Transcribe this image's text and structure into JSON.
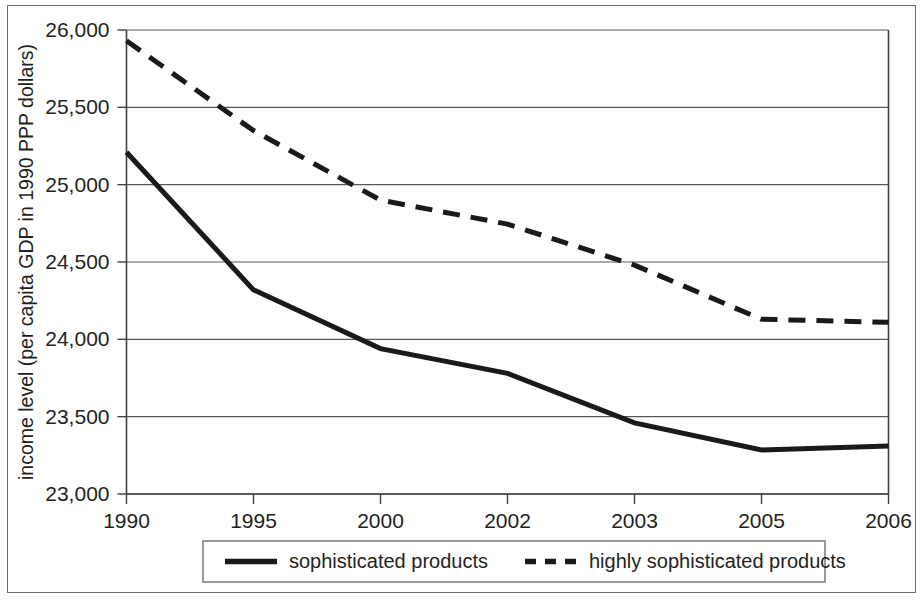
{
  "chart_data": {
    "type": "line",
    "title": "",
    "subtitle": "",
    "xlabel": "",
    "ylabel": "income level (per capita GDP in 1990 PPP dollars)",
    "categories": [
      "1990",
      "1995",
      "2000",
      "2002",
      "2003",
      "2005",
      "2006"
    ],
    "x_tick_labels": [
      "1990",
      "1995",
      "2000",
      "2002",
      "2003",
      "2005",
      "2006"
    ],
    "y_tick_labels": [
      "23,000",
      "23,500",
      "24,000",
      "24,500",
      "25,000",
      "25,500",
      "26,000"
    ],
    "y_tick_values": [
      23000,
      23500,
      24000,
      24500,
      25000,
      25500,
      26000
    ],
    "ylim": [
      23000,
      26000
    ],
    "grid": "horizontal",
    "legend_position": "bottom",
    "series": [
      {
        "name": "sophisticated products",
        "style": "solid",
        "color": "#1a1a1a",
        "values": [
          25210,
          24320,
          23940,
          23780,
          23460,
          23285,
          23310
        ]
      },
      {
        "name": "highly sophisticated products",
        "style": "dashed",
        "color": "#1a1a1a",
        "values": [
          25930,
          25350,
          24900,
          24745,
          24480,
          24130,
          24110
        ]
      }
    ]
  },
  "legend": {
    "entries": [
      {
        "label": "sophisticated products",
        "style": "solid"
      },
      {
        "label": "highly sophisticated products",
        "style": "dashed"
      }
    ]
  },
  "axes": {
    "y_axis_title": "income level (per capita GDP in 1990 PPP dollars)"
  },
  "colors": {
    "series_ink": "#1a1a1a",
    "gridline": "#58585b",
    "axis": "#404041",
    "frame": "#6e6e70",
    "background": "#ffffff",
    "text": "#231f20"
  }
}
